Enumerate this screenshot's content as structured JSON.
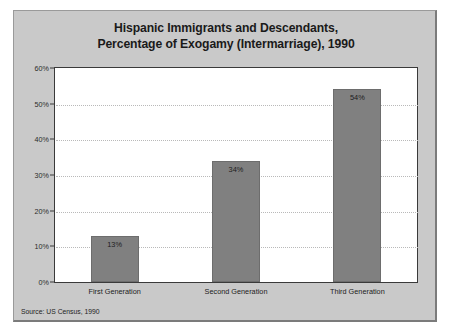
{
  "figure": {
    "title_line1": "Hispanic Immigrants and Descendants,",
    "title_line2": "Percentage of Exogamy (Intermarriage), 1990",
    "source": "Source: US Census, 1990",
    "panel_color": "#c9c9c9",
    "plot_bg_color": "#ffffff",
    "bar_color": "#808080",
    "grid_color": "#b9b9b9",
    "axis_color": "#3a3a3a",
    "text_color": "#1a1a1a"
  },
  "chart_data": {
    "type": "bar",
    "title": "Hispanic Immigrants and Descendants, Percentage of Exogamy (Intermarriage), 1990",
    "xlabel": "",
    "ylabel": "",
    "categories": [
      "First Generation",
      "Second Generation",
      "Third Generation"
    ],
    "values": [
      13,
      34,
      54
    ],
    "value_labels": [
      "13%",
      "34%",
      "54%"
    ],
    "ylim": [
      0,
      60
    ],
    "yticks": [
      0,
      10,
      20,
      30,
      40,
      50,
      60
    ],
    "ytick_labels": [
      "0%",
      "10%",
      "20%",
      "30%",
      "40%",
      "50%",
      "60%"
    ],
    "grid": true,
    "grid_axis": "y",
    "legend": false,
    "legend_position": "none",
    "source_note": "Source: US Census, 1990"
  }
}
